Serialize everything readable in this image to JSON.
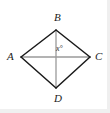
{
  "figure": {
    "kind": "quadrilateral-with-diagonals",
    "shape_name": "rhombus ABCD",
    "background_color": "#ffffff",
    "side_color": "#1a1a1a",
    "diagonal_color": "#9a9a9a",
    "label_color": "#1c1c1c",
    "vertices": [
      {
        "id": "A",
        "label": "A",
        "x": 21,
        "y": 57,
        "position": "left"
      },
      {
        "id": "B",
        "label": "B",
        "x": 56,
        "y": 30,
        "position": "top"
      },
      {
        "id": "C",
        "label": "C",
        "x": 90,
        "y": 57,
        "position": "right"
      },
      {
        "id": "D",
        "label": "D",
        "x": 56,
        "y": 88,
        "position": "bottom"
      }
    ],
    "sides": [
      {
        "from": "A",
        "to": "B"
      },
      {
        "from": "B",
        "to": "C"
      },
      {
        "from": "C",
        "to": "D"
      },
      {
        "from": "D",
        "to": "A"
      }
    ],
    "diagonals": [
      {
        "from": "A",
        "to": "C",
        "orientation": "horizontal"
      },
      {
        "from": "B",
        "to": "D",
        "orientation": "vertical"
      }
    ],
    "angle_labels": [
      {
        "id": "x",
        "text": "x°",
        "at_vertex": "intersection-of-diagonals",
        "x": 56,
        "y": 45
      }
    ]
  }
}
